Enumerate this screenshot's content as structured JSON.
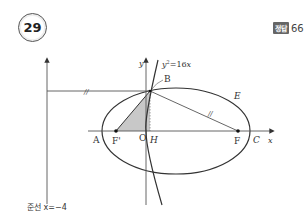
{
  "problem": {
    "number": "29",
    "answer_label": "정답",
    "answer_value": "66"
  },
  "figure": {
    "axis_labels": {
      "x": "x",
      "y": "y"
    },
    "curve_labels": {
      "parabola": "y²=16x",
      "ellipse": "E"
    },
    "points": {
      "A": "A",
      "F_prime": "F'",
      "O": "O",
      "H": "H",
      "F": "F",
      "C": "C",
      "B": "B"
    },
    "directrix_label": "준선 x=−4",
    "equal_marks": "//",
    "colors": {
      "stroke": "#333333",
      "axis": "#555555",
      "shade": "#c8c8c8"
    }
  }
}
